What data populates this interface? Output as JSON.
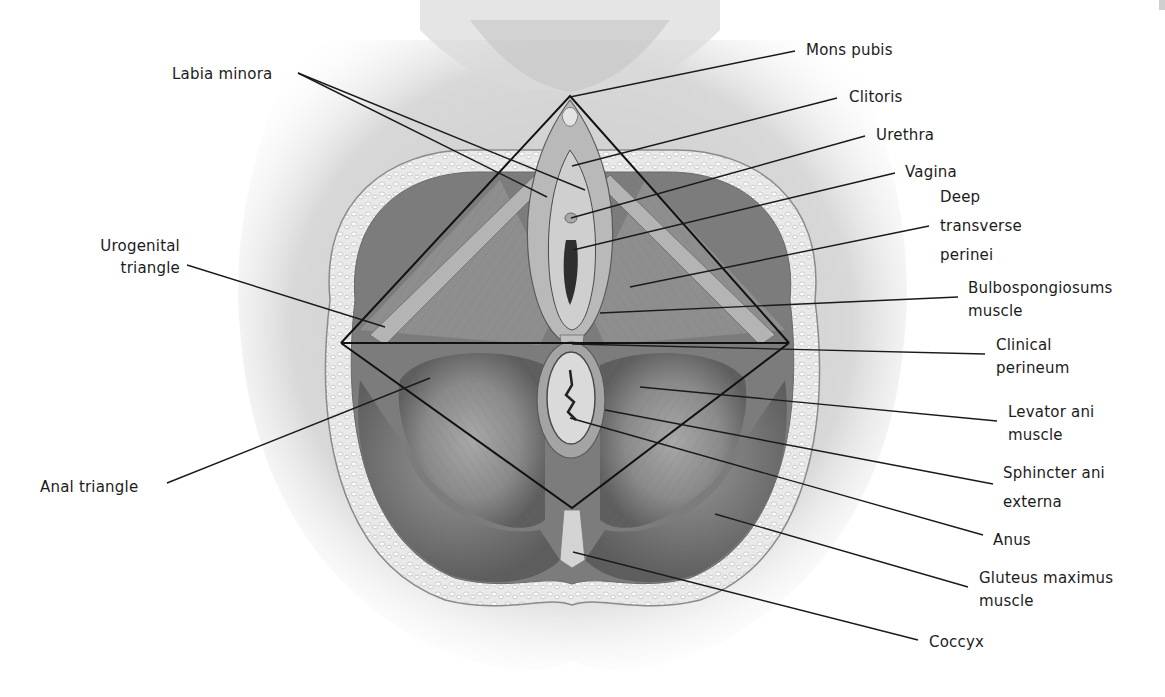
{
  "figure": {
    "triangle_vertices": {
      "top": [
        570,
        96
      ],
      "left": [
        341,
        343
      ],
      "right": [
        789,
        343
      ],
      "bottom": [
        572,
        508
      ]
    },
    "colors": {
      "background": "#ffffff",
      "skin_shadow": "#d9d9d9",
      "tissue_mid": "#9a9a9a",
      "tissue_dark": "#5c5c5c",
      "leader_line": "#1a1a1a",
      "fat_layer": "#e8e8e8"
    }
  },
  "labels": {
    "labia_minora": "Labia minora",
    "urogenital_triangle_1": "Urogenital",
    "urogenital_triangle_2": "triangle",
    "anal_triangle": "Anal triangle",
    "mons_pubis": "Mons pubis",
    "clitoris": "Clitoris",
    "urethra": "Urethra",
    "vagina": "Vagina",
    "deep_transverse_1": "Deep",
    "deep_transverse_2": "transverse",
    "deep_transverse_3": "perinei",
    "bulbospongiosus_1": "Bulbospongiosums",
    "bulbospongiosus_2": "muscle",
    "clinical_perineum_1": "Clinical",
    "clinical_perineum_2": "perineum",
    "levator_ani_1": "Levator ani",
    "levator_ani_2": "muscle",
    "sphincter_ani_1": "Sphincter ani",
    "sphincter_ani_2": "externa",
    "anus": "Anus",
    "gluteus_1": "Gluteus maximus",
    "gluteus_2": "muscle",
    "coccyx": "Coccyx"
  }
}
